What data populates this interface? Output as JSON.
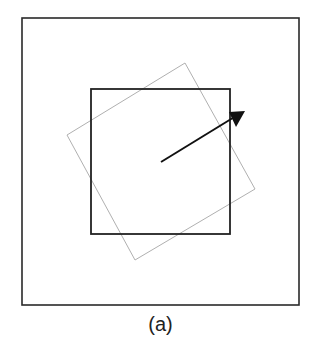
{
  "figure": {
    "caption": "(a)",
    "colors": {
      "outer_frame": "#2a2a2a",
      "inner_square": "#222222",
      "rotated_square": "#b0b0b0",
      "arrow": "#111111"
    },
    "shapes": {
      "outer_frame": {
        "x": 22,
        "y": 18,
        "width": 277,
        "height": 287
      },
      "inner_square": {
        "x": 91,
        "y": 89,
        "width": 139,
        "height": 145
      },
      "rotated_square": {
        "points": "185,63 255,189 135,260 67,135"
      },
      "arrow": {
        "x1": 161,
        "y1": 162,
        "x2": 244,
        "y2": 111
      }
    }
  }
}
